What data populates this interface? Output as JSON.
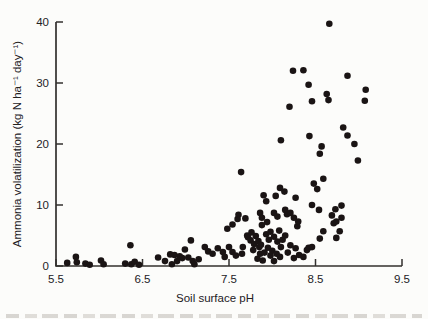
{
  "figure": {
    "background": "#fcfcfa",
    "has_cropped_caption_fragment": true
  },
  "chart_data": {
    "type": "scatter",
    "title": "",
    "xlabel": "Soil surface pH",
    "ylabel": "Ammonia volatilization (kg N ha⁻¹ day⁻¹)",
    "xlim": [
      5.5,
      9.5
    ],
    "ylim": [
      0,
      40
    ],
    "x_ticks": [
      "5.5",
      "6.5",
      "7.5",
      "8.5",
      "9.5"
    ],
    "y_ticks": [
      "0",
      "10",
      "20",
      "30",
      "40"
    ],
    "grid": false,
    "legend": "none",
    "marker": {
      "shape": "filled-circle",
      "color": "#1a1414",
      "radius_px": 3.3
    },
    "axis_color": "#33302e",
    "label_color": "#23211f",
    "points": [
      [
        5.63,
        0.5
      ],
      [
        5.73,
        1.5
      ],
      [
        5.74,
        0.6
      ],
      [
        5.84,
        0.4
      ],
      [
        5.89,
        0.2
      ],
      [
        6.02,
        0.9
      ],
      [
        6.05,
        0.3
      ],
      [
        6.3,
        0.4
      ],
      [
        6.36,
        3.4
      ],
      [
        6.37,
        0.3
      ],
      [
        6.41,
        0.7
      ],
      [
        6.46,
        0.2
      ],
      [
        6.68,
        1.4
      ],
      [
        6.76,
        0.8
      ],
      [
        6.82,
        1.9
      ],
      [
        6.84,
        0.3
      ],
      [
        6.87,
        1.8
      ],
      [
        6.9,
        0.8
      ],
      [
        6.93,
        1.6
      ],
      [
        6.96,
        1.3
      ],
      [
        6.99,
        2.7
      ],
      [
        7.03,
        1.4
      ],
      [
        7.06,
        4.2
      ],
      [
        7.08,
        0.8
      ],
      [
        7.1,
        0.3
      ],
      [
        7.15,
        1.1
      ],
      [
        7.22,
        3.1
      ],
      [
        7.26,
        2.4
      ],
      [
        7.31,
        2.0
      ],
      [
        7.37,
        2.9
      ],
      [
        7.43,
        2.3
      ],
      [
        7.45,
        1.5
      ],
      [
        7.48,
        6.1
      ],
      [
        7.5,
        3.1
      ],
      [
        7.54,
        2.3
      ],
      [
        7.54,
        6.8
      ],
      [
        7.58,
        1.7
      ],
      [
        7.6,
        7.7
      ],
      [
        7.61,
        8.4
      ],
      [
        7.64,
        15.4
      ],
      [
        7.65,
        2.0
      ],
      [
        7.66,
        3.1
      ],
      [
        7.69,
        7.8
      ],
      [
        7.71,
        5.0
      ],
      [
        7.72,
        4.7
      ],
      [
        7.75,
        4.2
      ],
      [
        7.76,
        5.5
      ],
      [
        7.78,
        2.6
      ],
      [
        7.79,
        3.6
      ],
      [
        7.81,
        4.9
      ],
      [
        7.83,
        1.2
      ],
      [
        7.84,
        4.1
      ],
      [
        7.85,
        3.1
      ],
      [
        7.86,
        8.7
      ],
      [
        7.86,
        2.0
      ],
      [
        7.87,
        3.5
      ],
      [
        7.88,
        6.7
      ],
      [
        7.88,
        7.9
      ],
      [
        7.89,
        0.9
      ],
      [
        7.9,
        11.6
      ],
      [
        7.91,
        2.2
      ],
      [
        7.93,
        10.6
      ],
      [
        7.93,
        5.2
      ],
      [
        7.94,
        7.2
      ],
      [
        7.95,
        3.0
      ],
      [
        7.96,
        4.3
      ],
      [
        7.98,
        5.6
      ],
      [
        7.98,
        1.7
      ],
      [
        8.0,
        2.5
      ],
      [
        8.02,
        8.7
      ],
      [
        8.02,
        4.8
      ],
      [
        8.02,
        0.8
      ],
      [
        8.04,
        11.5
      ],
      [
        8.05,
        2.0
      ],
      [
        8.06,
        8.1
      ],
      [
        8.06,
        4.0
      ],
      [
        8.08,
        5.8
      ],
      [
        8.09,
        12.8
      ],
      [
        8.09,
        1.5
      ],
      [
        8.1,
        3.1
      ],
      [
        8.1,
        20.6
      ],
      [
        8.12,
        4.3
      ],
      [
        8.14,
        12.2
      ],
      [
        8.15,
        9.2
      ],
      [
        8.15,
        5.0
      ],
      [
        8.17,
        8.5
      ],
      [
        8.18,
        2.2
      ],
      [
        8.2,
        26.1
      ],
      [
        8.21,
        8.7
      ],
      [
        8.21,
        3.4
      ],
      [
        8.24,
        32.0
      ],
      [
        8.25,
        7.9
      ],
      [
        8.25,
        1.3
      ],
      [
        8.27,
        11.2
      ],
      [
        8.27,
        2.9
      ],
      [
        8.29,
        6.5
      ],
      [
        8.3,
        7.3
      ],
      [
        8.31,
        1.8
      ],
      [
        8.36,
        32.1
      ],
      [
        8.36,
        1.5
      ],
      [
        8.4,
        2.6
      ],
      [
        8.42,
        29.7
      ],
      [
        8.42,
        3.0
      ],
      [
        8.43,
        21.3
      ],
      [
        8.46,
        27.0
      ],
      [
        8.46,
        10.0
      ],
      [
        8.46,
        3.1
      ],
      [
        8.48,
        13.5
      ],
      [
        8.52,
        12.6
      ],
      [
        8.54,
        9.2
      ],
      [
        8.55,
        18.4
      ],
      [
        8.55,
        4.5
      ],
      [
        8.57,
        19.6
      ],
      [
        8.59,
        14.3
      ],
      [
        8.59,
        5.7
      ],
      [
        8.63,
        28.2
      ],
      [
        8.65,
        27.2
      ],
      [
        8.66,
        39.7
      ],
      [
        8.69,
        8.3
      ],
      [
        8.71,
        7.0
      ],
      [
        8.73,
        9.3
      ],
      [
        8.74,
        4.6
      ],
      [
        8.74,
        7.3
      ],
      [
        8.78,
        5.7
      ],
      [
        8.8,
        9.9
      ],
      [
        8.8,
        7.9
      ],
      [
        8.82,
        22.7
      ],
      [
        8.87,
        31.2
      ],
      [
        8.87,
        21.4
      ],
      [
        8.95,
        20.0
      ],
      [
        8.99,
        17.3
      ],
      [
        9.07,
        27.1
      ],
      [
        9.08,
        28.9
      ]
    ]
  }
}
